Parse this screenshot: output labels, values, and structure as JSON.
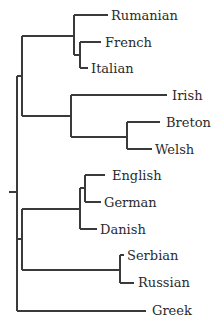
{
  "tree": {
    "title": "",
    "leaves": [
      {
        "id": "rumanian",
        "label": "Rumanian"
      },
      {
        "id": "french",
        "label": "French"
      },
      {
        "id": "italian",
        "label": "Italian"
      },
      {
        "id": "irish",
        "label": "Irish"
      },
      {
        "id": "breton",
        "label": "Breton"
      },
      {
        "id": "welsh",
        "label": "Welsh"
      },
      {
        "id": "english",
        "label": "English"
      },
      {
        "id": "german",
        "label": "German"
      },
      {
        "id": "danish",
        "label": "Danish"
      },
      {
        "id": "serbian",
        "label": "Serbian"
      },
      {
        "id": "russian",
        "label": "Russian"
      },
      {
        "id": "greek",
        "label": "Greek"
      }
    ],
    "newick": "((((Rumanian,(French,Italian)),(Irish,(Breton,Welsh)))),(((English,German),Danish),(Serbian,Russian)),Greek);"
  }
}
